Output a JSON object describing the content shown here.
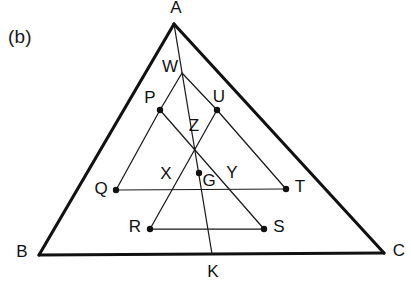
{
  "figure": {
    "panel_label": "(b)",
    "caption_label": "(b)",
    "stroke_colors": {
      "outer_triangle": "#111111",
      "inner_lines": "#1a1a1a",
      "labels": "#111111",
      "background": "#ffffff"
    },
    "outer_triangle": {
      "name": "triangle-abc",
      "vertices": [
        {
          "id": "A",
          "label": "A",
          "x": 174,
          "y": 24,
          "label_x": 176,
          "label_y": 9,
          "marked": false
        },
        {
          "id": "B",
          "label": "B",
          "x": 39,
          "y": 255,
          "label_x": 22,
          "label_y": 253,
          "marked": false
        },
        {
          "id": "C",
          "label": "C",
          "x": 384,
          "y": 253,
          "label_x": 399,
          "label_y": 252,
          "marked": false
        }
      ]
    },
    "points": [
      {
        "id": "W",
        "label": "W",
        "x": 182,
        "y": 73,
        "label_x": 170,
        "label_y": 68,
        "marked": false
      },
      {
        "id": "P",
        "label": "P",
        "x": 160,
        "y": 110,
        "label_x": 150,
        "label_y": 99,
        "marked": true
      },
      {
        "id": "U",
        "label": "U",
        "x": 217,
        "y": 110,
        "label_x": 219,
        "label_y": 98,
        "marked": true
      },
      {
        "id": "Z",
        "label": "Z",
        "x": 196,
        "y": 150,
        "label_x": 194,
        "label_y": 127,
        "marked": false
      },
      {
        "id": "G",
        "label": "G",
        "x": 199,
        "y": 173,
        "label_x": 209,
        "label_y": 182,
        "marked": true
      },
      {
        "id": "Q",
        "label": "Q",
        "x": 116,
        "y": 190,
        "label_x": 101,
        "label_y": 190,
        "marked": true
      },
      {
        "id": "T",
        "label": "T",
        "x": 286,
        "y": 189,
        "label_x": 300,
        "label_y": 188,
        "marked": true
      },
      {
        "id": "R",
        "label": "R",
        "x": 150,
        "y": 229,
        "label_x": 135,
        "label_y": 228,
        "marked": true
      },
      {
        "id": "S",
        "label": "S",
        "x": 264,
        "y": 229,
        "label_x": 279,
        "label_y": 228,
        "marked": true
      },
      {
        "id": "K",
        "label": "K",
        "x": 212,
        "y": 254,
        "label_x": 213,
        "label_y": 273,
        "marked": false
      }
    ],
    "region_labels": [
      {
        "id": "X",
        "label": "X",
        "x": 166,
        "y": 175
      },
      {
        "id": "Y",
        "label": "Y",
        "x": 232,
        "y": 174
      }
    ],
    "segments": [
      {
        "name": "edge-ab",
        "kind": "outer",
        "from": "A",
        "to": "B",
        "x1": 174,
        "y1": 24,
        "x2": 39,
        "y2": 255
      },
      {
        "name": "edge-ac",
        "kind": "outer",
        "from": "A",
        "to": "C",
        "x1": 174,
        "y1": 24,
        "x2": 384,
        "y2": 253
      },
      {
        "name": "edge-bc",
        "kind": "outer",
        "from": "B",
        "to": "C",
        "x1": 39,
        "y1": 255,
        "x2": 384,
        "y2": 253
      },
      {
        "name": "cevian-a-k",
        "kind": "inner",
        "from": "A",
        "to": "K",
        "x1": 174,
        "y1": 24,
        "x2": 212,
        "y2": 254
      },
      {
        "name": "segment-w-p",
        "kind": "inner",
        "from": "W",
        "to": "P",
        "x1": 182,
        "y1": 73,
        "x2": 160,
        "y2": 110
      },
      {
        "name": "segment-p-q",
        "kind": "inner",
        "from": "P",
        "to": "Q",
        "x1": 160,
        "y1": 110,
        "x2": 116,
        "y2": 190
      },
      {
        "name": "segment-w-u",
        "kind": "inner",
        "from": "W",
        "to": "U",
        "x1": 182,
        "y1": 73,
        "x2": 217,
        "y2": 110
      },
      {
        "name": "segment-u-t",
        "kind": "inner",
        "from": "U",
        "to": "T",
        "x1": 217,
        "y1": 110,
        "x2": 286,
        "y2": 189
      },
      {
        "name": "segment-p-s",
        "kind": "inner",
        "from": "P",
        "to": "S",
        "x1": 160,
        "y1": 110,
        "x2": 264,
        "y2": 229
      },
      {
        "name": "segment-u-r",
        "kind": "inner",
        "from": "U",
        "to": "R",
        "x1": 217,
        "y1": 110,
        "x2": 150,
        "y2": 229
      },
      {
        "name": "segment-q-t",
        "kind": "inner",
        "from": "Q",
        "to": "T",
        "x1": 116,
        "y1": 190,
        "x2": 286,
        "y2": 189
      },
      {
        "name": "segment-r-s",
        "kind": "inner",
        "from": "R",
        "to": "S",
        "x1": 150,
        "y1": 229,
        "x2": 264,
        "y2": 229
      }
    ]
  }
}
